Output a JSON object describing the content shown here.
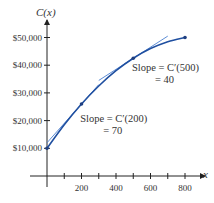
{
  "chart_data": {
    "type": "line",
    "title": "",
    "xlabel": "x",
    "ylabel": "C(x)",
    "xlim": [
      0,
      850
    ],
    "ylim": [
      0,
      55000
    ],
    "x_ticks": [
      100,
      200,
      300,
      400,
      500,
      600,
      700,
      800
    ],
    "x_tick_labels": [
      {
        "value": 200,
        "label": "200"
      },
      {
        "value": 400,
        "label": "400"
      },
      {
        "value": 600,
        "label": "600"
      },
      {
        "value": 800,
        "label": "800"
      }
    ],
    "y_ticks": [
      {
        "value": 10000,
        "label": "$10,000"
      },
      {
        "value": 20000,
        "label": "$20,000"
      },
      {
        "value": 30000,
        "label": "$30,000"
      },
      {
        "value": 40000,
        "label": "$40,000"
      },
      {
        "value": 50000,
        "label": "$50,000"
      }
    ],
    "grid": false,
    "series": [
      {
        "name": "C(x)",
        "color": "#1f4fa0",
        "x": [
          0,
          100,
          200,
          300,
          400,
          500,
          600,
          700,
          800
        ],
        "y": [
          10000,
          18500,
          26000,
          32500,
          38000,
          42500,
          46000,
          48500,
          50000
        ]
      }
    ],
    "points": [
      {
        "x": 0,
        "y": 10000
      },
      {
        "x": 200,
        "y": 26000
      },
      {
        "x": 500,
        "y": 42500
      },
      {
        "x": 800,
        "y": 50000
      }
    ],
    "tangents": [
      {
        "at_x": 200,
        "at_y": 26000,
        "slope": 70,
        "x_range": [
          0,
          300
        ],
        "color": "#4a7fd0"
      },
      {
        "at_x": 500,
        "at_y": 42500,
        "slope": 40,
        "x_range": [
          300,
          700
        ],
        "color": "#4a7fd0"
      }
    ],
    "annotations": [
      {
        "line1": "Slope = C′(200)",
        "line2": "= 70",
        "x": 250,
        "y": 19500
      },
      {
        "line1": "Slope = C′(500)",
        "line2": "= 40",
        "x": 550,
        "y": 38000
      }
    ]
  }
}
